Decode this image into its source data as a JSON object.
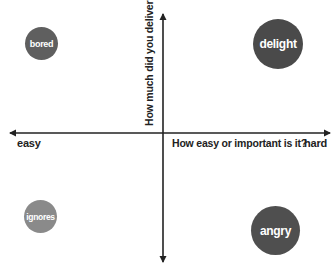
{
  "diagram": {
    "type": "quadrant",
    "x_axis": {
      "title": "How easy or important is it?",
      "left_label": "easy",
      "right_label": "hard"
    },
    "y_axis": {
      "title": "How much did you deliver?"
    },
    "quadrants": [
      {
        "position": "top-left",
        "label": "bored",
        "color": "#5f5f5f",
        "size": "small"
      },
      {
        "position": "top-right",
        "label": "delight",
        "color": "#4a4a4a",
        "size": "large"
      },
      {
        "position": "bottom-left",
        "label": "ignores",
        "color": "#8a8a8a",
        "size": "small"
      },
      {
        "position": "bottom-right",
        "label": "angry",
        "color": "#4f4f4f",
        "size": "large"
      }
    ],
    "axis_color": "#222222"
  }
}
